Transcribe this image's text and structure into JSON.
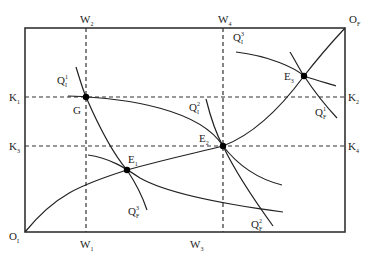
{
  "diagram": {
    "type": "edgeworth-box",
    "origins": {
      "bottom_left": {
        "main": "O",
        "sub": "I"
      },
      "top_right": {
        "main": "O",
        "sub": "F"
      }
    },
    "top_axis_labels": [
      {
        "main": "W",
        "sub": "2"
      },
      {
        "main": "W",
        "sub": "4"
      }
    ],
    "bottom_axis_labels": [
      {
        "main": "W",
        "sub": "1"
      },
      {
        "main": "W",
        "sub": "3"
      }
    ],
    "left_axis_labels": [
      {
        "main": "K",
        "sub": "1"
      },
      {
        "main": "K",
        "sub": "3"
      }
    ],
    "right_axis_labels": [
      {
        "main": "K",
        "sub": "2"
      },
      {
        "main": "K",
        "sub": "4"
      }
    ],
    "points": [
      {
        "main": "G",
        "sub": ""
      },
      {
        "main": "E",
        "sub": "1"
      },
      {
        "main": "E",
        "sub": "2"
      },
      {
        "main": "E",
        "sub": "3"
      }
    ],
    "isoquants": [
      {
        "main": "Q",
        "sub": "I",
        "sup": "1"
      },
      {
        "main": "Q",
        "sub": "I",
        "sup": "2"
      },
      {
        "main": "Q",
        "sub": "I",
        "sup": "3"
      },
      {
        "main": "Q",
        "sub": "F",
        "sup": "1"
      },
      {
        "main": "Q",
        "sub": "F",
        "sup": "2"
      },
      {
        "main": "Q",
        "sub": "F",
        "sup": "3"
      }
    ],
    "colors": {
      "line": "#222222",
      "background": "#ffffff"
    }
  }
}
